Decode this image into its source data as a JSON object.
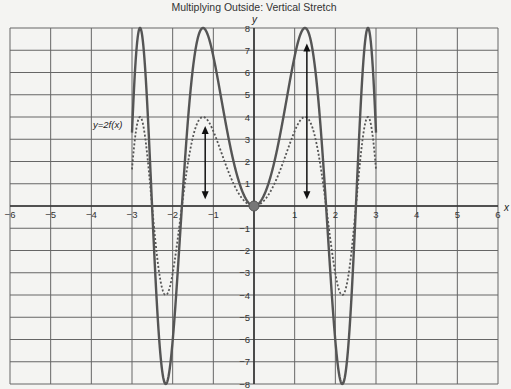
{
  "chart_data": {
    "type": "line",
    "title": "Multiplying Outside: Vertical Stretch",
    "xlabel": "x",
    "ylabel": "y",
    "xlim": [
      -6,
      6
    ],
    "ylim": [
      -8,
      8
    ],
    "grid": true,
    "x_ticks": [
      -6,
      -5,
      -4,
      -3,
      -2,
      -1,
      1,
      2,
      3,
      4,
      5,
      6
    ],
    "y_ticks": [
      -8,
      -7,
      -6,
      -5,
      -4,
      -3,
      -2,
      -1,
      1,
      2,
      3,
      4,
      5,
      6,
      7,
      8
    ],
    "series": [
      {
        "name": "y = f(x)",
        "style": "dashed",
        "formula": "4 sin(x^2)",
        "domain": [
          -3,
          3
        ],
        "key_points": [
          [
            -3,
            1.65
          ],
          [
            -2.8,
            4
          ],
          [
            -2.17,
            -4
          ],
          [
            -1.25,
            4
          ],
          [
            0,
            0
          ],
          [
            1.25,
            4
          ],
          [
            2.17,
            -4
          ],
          [
            2.8,
            4
          ],
          [
            3,
            1.65
          ]
        ]
      },
      {
        "name": "y = 2f(x)",
        "style": "solid",
        "formula": "8 sin(x^2)",
        "domain": [
          -3,
          3
        ],
        "key_points": [
          [
            -3,
            3.3
          ],
          [
            -2.8,
            8
          ],
          [
            -2.17,
            -8
          ],
          [
            -1.25,
            8
          ],
          [
            0,
            0
          ],
          [
            1.25,
            8
          ],
          [
            2.17,
            -8
          ],
          [
            2.8,
            8
          ],
          [
            3,
            3.3
          ]
        ]
      }
    ],
    "annotations": [
      {
        "text": "y=2f(x)",
        "x": -3.6,
        "y": 3.8
      },
      {
        "type": "double-arrow",
        "x": -1.2,
        "y_from": 0.3,
        "y_to": 3.6
      },
      {
        "type": "double-arrow",
        "x": 1.3,
        "y_from": 0.3,
        "y_to": 7.3
      },
      {
        "type": "point",
        "x": 0,
        "y": 0
      }
    ]
  },
  "labels": {
    "title": "Multiplying Outside: Vertical Stretch",
    "x_axis": "x",
    "y_axis": "y",
    "annotation": "y=2f(x)"
  }
}
